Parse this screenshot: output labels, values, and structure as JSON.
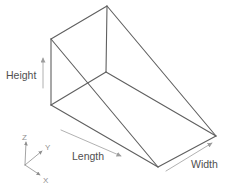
{
  "figure": {
    "type": "wedge-wireframe-diagram",
    "colors": {
      "edge": "#5f5f5f",
      "dimension_line": "#9d9d9d",
      "dimension_label": "#4f4f4f",
      "axis_line": "#8d8d8d",
      "axis_label": "#8f8f8f",
      "background": "#ffffff"
    },
    "vertices": {
      "A": [
        51,
        39
      ],
      "B": [
        107,
        6
      ],
      "C": [
        51,
        105
      ],
      "D": [
        106,
        72
      ],
      "E": [
        158,
        167
      ],
      "F": [
        216,
        136
      ]
    },
    "edges": [
      [
        "A",
        "B"
      ],
      [
        "A",
        "C"
      ],
      [
        "A",
        "E"
      ],
      [
        "B",
        "D"
      ],
      [
        "B",
        "F"
      ],
      [
        "C",
        "D"
      ],
      [
        "C",
        "E"
      ],
      [
        "D",
        "F"
      ],
      [
        "E",
        "F"
      ]
    ],
    "dimensions": {
      "height": {
        "label": "Height",
        "arrow_from": [
          43,
          88
        ],
        "arrow_to": [
          43,
          58
        ]
      },
      "length": {
        "label": "Length",
        "arrow_from": [
          61,
          130
        ],
        "arrow_to": [
          121,
          156
        ]
      },
      "width": {
        "label": "Width",
        "arrow_from": [
          166,
          171
        ],
        "arrow_to": [
          212,
          143
        ]
      }
    },
    "axes": {
      "origin": [
        25,
        165
      ],
      "items": [
        {
          "label": "Z",
          "to": [
            26,
            142
          ]
        },
        {
          "label": "Y",
          "to": [
            42,
            151
          ]
        },
        {
          "label": "X",
          "to": [
            40,
            175
          ]
        }
      ]
    }
  }
}
